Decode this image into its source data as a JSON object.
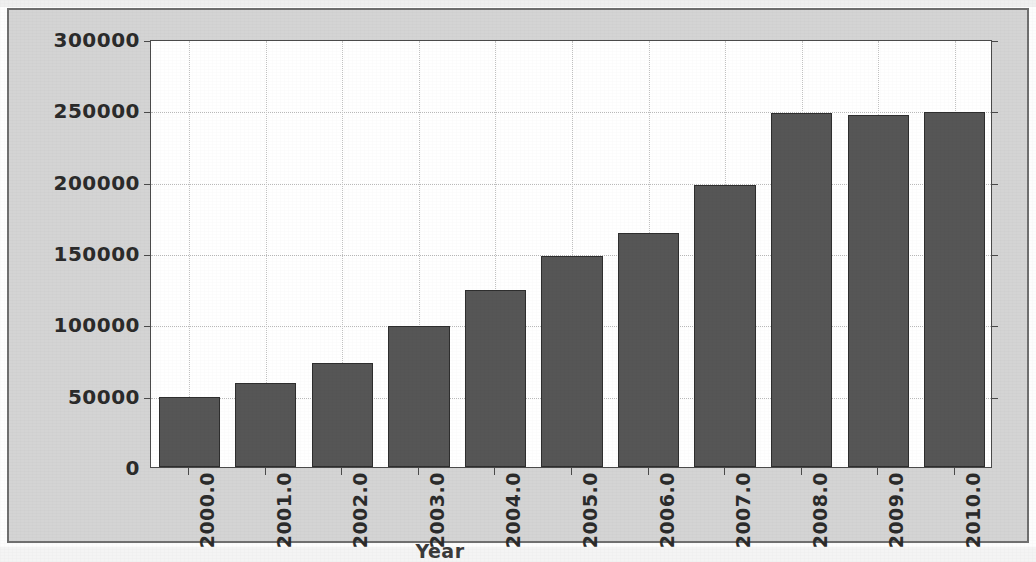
{
  "figure": {
    "background_color": "#d4d4d4",
    "plot_background_color": "#ffffff",
    "frame_color": "#6f6f6f",
    "axis_color": "#4a4a4a",
    "bar_color": "#565656",
    "bar_edge_color": "#2e2e2e",
    "gridline_color": "#b9b9b9"
  },
  "chart_data": {
    "type": "bar",
    "title": "",
    "xlabel": "Year",
    "ylabel": "",
    "categories": [
      "2000.0",
      "2001.0",
      "2002.0",
      "2003.0",
      "2004.0",
      "2005.0",
      "2006.0",
      "2007.0",
      "2008.0",
      "2009.0",
      "2010.0"
    ],
    "values": [
      49000,
      59000,
      73000,
      99000,
      124000,
      148000,
      164000,
      198000,
      248000,
      247000,
      249000
    ],
    "ylim": [
      0,
      300000
    ],
    "xlim": [
      1999.5,
      2010.5
    ],
    "ytick_labels": [
      "0",
      "50000",
      "100000",
      "150000",
      "200000",
      "250000",
      "300000"
    ],
    "ytick_values": [
      0,
      50000,
      100000,
      150000,
      200000,
      250000,
      300000
    ],
    "xtick_labels": [
      "2000.0",
      "2001.0",
      "2002.0",
      "2003.0",
      "2004.0",
      "2005.0",
      "2006.0",
      "2007.0",
      "2008.0",
      "2009.0",
      "2010.0"
    ],
    "xtick_rotation_degrees": 90,
    "grid": true,
    "grid_style": "dotted",
    "legend": null,
    "legend_position": "none",
    "bar_width_fraction": 0.8,
    "series": [
      {
        "name": "count",
        "values": [
          49000,
          59000,
          73000,
          99000,
          124000,
          148000,
          164000,
          198000,
          248000,
          247000,
          249000
        ]
      }
    ],
    "points": [
      {
        "x": "2000.0",
        "y": 49000
      },
      {
        "x": "2001.0",
        "y": 59000
      },
      {
        "x": "2002.0",
        "y": 73000
      },
      {
        "x": "2003.0",
        "y": 99000
      },
      {
        "x": "2004.0",
        "y": 124000
      },
      {
        "x": "2005.0",
        "y": 148000
      },
      {
        "x": "2006.0",
        "y": 164000
      },
      {
        "x": "2007.0",
        "y": 198000
      },
      {
        "x": "2008.0",
        "y": 248000
      },
      {
        "x": "2009.0",
        "y": 247000
      },
      {
        "x": "2010.0",
        "y": 249000
      }
    ]
  }
}
